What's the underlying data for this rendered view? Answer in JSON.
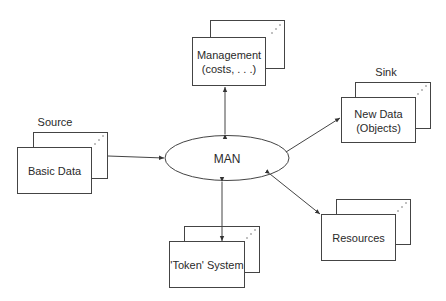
{
  "diagram": {
    "center": {
      "label": "MAN"
    },
    "nodes": [
      {
        "id": "management",
        "label_line1": "Management",
        "label_line2": "(costs, . . .)",
        "caption": ""
      },
      {
        "id": "source",
        "label_line1": "Basic Data",
        "caption": "Source"
      },
      {
        "id": "sink",
        "label_line1": "New Data",
        "label_line2": "(Objects)",
        "caption": "Sink"
      },
      {
        "id": "token",
        "label_line1": "'Token' System",
        "caption": ""
      },
      {
        "id": "resources",
        "label_line1": "Resources",
        "caption": ""
      }
    ],
    "edges": [
      {
        "from": "MAN",
        "to": "management",
        "direction": "both"
      },
      {
        "from": "source",
        "to": "MAN",
        "direction": "forward"
      },
      {
        "from": "MAN",
        "to": "sink",
        "direction": "forward"
      },
      {
        "from": "MAN",
        "to": "token",
        "direction": "both"
      },
      {
        "from": "MAN",
        "to": "resources",
        "direction": "both"
      }
    ]
  }
}
